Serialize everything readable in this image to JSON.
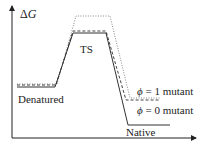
{
  "diagram": {
    "type": "energy-landscape",
    "y_axis_label_symbol": "Δ",
    "y_axis_label_var": "G",
    "states": {
      "denatured": "Denatured",
      "transition_state": "TS",
      "native": "Native"
    },
    "legend": [
      {
        "symbol": "ϕ",
        "text": " = 1 mutant",
        "style": "dotted"
      },
      {
        "symbol": "ϕ",
        "text": " = 0 mutant",
        "style": "dashed"
      }
    ],
    "paths": {
      "wild_type": {
        "style": "solid",
        "color": "#333333",
        "points": [
          [
            17,
            87
          ],
          [
            55,
            87
          ],
          [
            73,
            33
          ],
          [
            106,
            33
          ],
          [
            128,
            125
          ],
          [
            170,
            125
          ]
        ]
      },
      "phi0_mutant": {
        "style": "dashed",
        "color": "#444444",
        "points": [
          [
            17,
            85
          ],
          [
            56,
            85
          ],
          [
            73,
            31
          ],
          [
            106,
            31
          ],
          [
            126,
            100
          ],
          [
            160,
            100
          ]
        ]
      },
      "phi1_mutant": {
        "style": "dotted",
        "color": "#888888",
        "points": [
          [
            17,
            84
          ],
          [
            57,
            84
          ],
          [
            76,
            16
          ],
          [
            110,
            16
          ],
          [
            130,
            98
          ],
          [
            160,
            98
          ]
        ]
      }
    },
    "colors": {
      "axis": "#222222",
      "text": "#222222"
    }
  }
}
